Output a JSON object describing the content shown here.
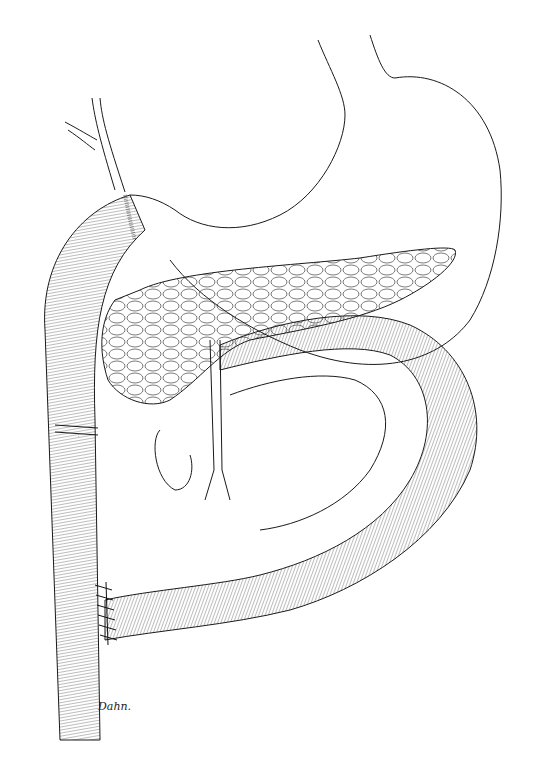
{
  "illustration": {
    "subject": "Surgical anatomy line drawing: stomach, pancreas, duodenum and jejunal loop with sutured anastomoses",
    "signature": "Dahn.",
    "colors": {
      "ink": "#1a1a1a",
      "background": "#ffffff"
    }
  }
}
